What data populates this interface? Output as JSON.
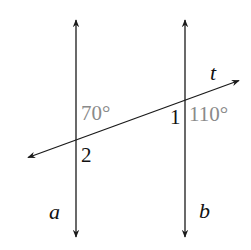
{
  "diagram": {
    "type": "parallel-lines-transversal",
    "colors": {
      "line": "#1a1a1a",
      "label": "#111111",
      "angle_label": "#8a8a8a",
      "background": "#ffffff"
    },
    "lines": {
      "a": {
        "label": "a",
        "x": 76,
        "y_top": 19,
        "y_bottom": 238
      },
      "b": {
        "label": "b",
        "x": 185,
        "y_top": 19,
        "y_bottom": 238
      },
      "t": {
        "label": "t",
        "x1": 27,
        "y1": 158,
        "x2": 240,
        "y2": 80
      }
    },
    "intersections": {
      "a_t": {
        "x": 76,
        "y": 140
      },
      "b_t": {
        "x": 185,
        "y": 99
      }
    },
    "labels": {
      "line_a": "a",
      "line_b": "b",
      "line_t": "t",
      "angle_1": "1",
      "angle_2": "2",
      "given_angle_left": "70°",
      "given_angle_right": "110°"
    }
  }
}
